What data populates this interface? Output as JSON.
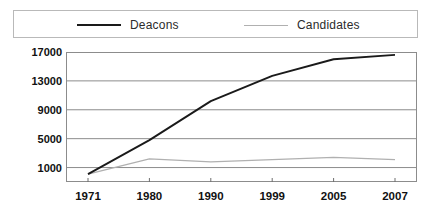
{
  "legend": {
    "entries": [
      {
        "label": "Deacons",
        "color": "#1a1a1a",
        "swatch": "line-swatch-dark"
      },
      {
        "label": "Candidates",
        "color": "#b0b0b0",
        "swatch": "line-swatch-light"
      }
    ]
  },
  "axes": {
    "y_ticks": [
      "17000",
      "13000",
      "9000",
      "5000",
      "1000"
    ],
    "x_ticks": [
      "1971",
      "1980",
      "1990",
      "1999",
      "2005",
      "2007"
    ]
  },
  "chart_data": {
    "type": "line",
    "title": "",
    "xlabel": "",
    "ylabel": "",
    "categories": [
      "1971",
      "1980",
      "1990",
      "1999",
      "2005",
      "2007"
    ],
    "series": [
      {
        "name": "Deacons",
        "color": "#1a1a1a",
        "values": [
          100,
          4800,
          10200,
          13700,
          16000,
          16600
        ]
      },
      {
        "name": "Candidates",
        "color": "#b0b0b0",
        "values": [
          100,
          2200,
          1800,
          2100,
          2400,
          2100
        ]
      }
    ],
    "ylim": [
      -1000,
      17000
    ],
    "yticks": [
      1000,
      5000,
      9000,
      13000,
      17000
    ],
    "grid": true,
    "legend_position": "top"
  }
}
